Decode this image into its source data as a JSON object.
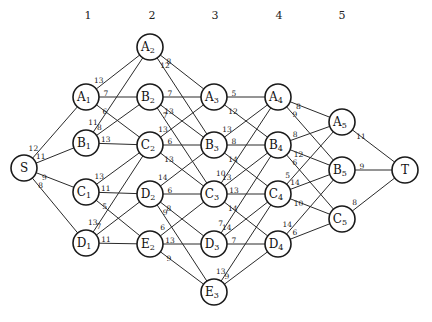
{
  "diagram": {
    "type": "directed-stage-graph",
    "stage_headers": [
      {
        "label": "1",
        "x": 88,
        "y": 19
      },
      {
        "label": "2",
        "x": 152,
        "y": 19
      },
      {
        "label": "3",
        "x": 215,
        "y": 19
      },
      {
        "label": "4",
        "x": 279,
        "y": 19
      },
      {
        "label": "5",
        "x": 342,
        "y": 19
      }
    ],
    "node_radius": 13,
    "nodes": [
      {
        "id": "S",
        "letter": "S",
        "sub": "",
        "x": 24,
        "y": 168
      },
      {
        "id": "A1",
        "letter": "A",
        "sub": "1",
        "x": 86,
        "y": 97
      },
      {
        "id": "B1",
        "letter": "B",
        "sub": "1",
        "x": 86,
        "y": 143
      },
      {
        "id": "C1",
        "letter": "C",
        "sub": "1",
        "x": 86,
        "y": 192
      },
      {
        "id": "D1",
        "letter": "D",
        "sub": "1",
        "x": 86,
        "y": 243
      },
      {
        "id": "A2",
        "letter": "A",
        "sub": "2",
        "x": 150,
        "y": 47
      },
      {
        "id": "B2",
        "letter": "B",
        "sub": "2",
        "x": 150,
        "y": 97
      },
      {
        "id": "C2",
        "letter": "C",
        "sub": "2",
        "x": 150,
        "y": 145
      },
      {
        "id": "D2",
        "letter": "D",
        "sub": "2",
        "x": 150,
        "y": 194
      },
      {
        "id": "E2",
        "letter": "E",
        "sub": "2",
        "x": 150,
        "y": 244
      },
      {
        "id": "A3",
        "letter": "A",
        "sub": "3",
        "x": 214,
        "y": 97
      },
      {
        "id": "B3",
        "letter": "B",
        "sub": "3",
        "x": 214,
        "y": 145
      },
      {
        "id": "C3",
        "letter": "C",
        "sub": "3",
        "x": 214,
        "y": 194
      },
      {
        "id": "D3",
        "letter": "D",
        "sub": "3",
        "x": 214,
        "y": 244
      },
      {
        "id": "E3",
        "letter": "E",
        "sub": "3",
        "x": 214,
        "y": 292
      },
      {
        "id": "A4",
        "letter": "A",
        "sub": "4",
        "x": 278,
        "y": 97
      },
      {
        "id": "B4",
        "letter": "B",
        "sub": "4",
        "x": 278,
        "y": 145
      },
      {
        "id": "C4",
        "letter": "C",
        "sub": "4",
        "x": 278,
        "y": 194
      },
      {
        "id": "D4",
        "letter": "D",
        "sub": "4",
        "x": 278,
        "y": 244
      },
      {
        "id": "A5",
        "letter": "A",
        "sub": "5",
        "x": 342,
        "y": 122
      },
      {
        "id": "B5",
        "letter": "B",
        "sub": "5",
        "x": 342,
        "y": 170
      },
      {
        "id": "C5",
        "letter": "C",
        "sub": "5",
        "x": 342,
        "y": 219
      },
      {
        "id": "T",
        "letter": "T",
        "sub": "",
        "x": 405,
        "y": 170
      }
    ],
    "edges": [
      {
        "from": "S",
        "to": "A1",
        "weight": "12"
      },
      {
        "from": "S",
        "to": "B1",
        "weight": "11"
      },
      {
        "from": "S",
        "to": "C1",
        "weight": "9"
      },
      {
        "from": "S",
        "to": "D1",
        "weight": "8"
      },
      {
        "from": "A1",
        "to": "A2",
        "weight": "13"
      },
      {
        "from": "A1",
        "to": "B2",
        "weight": "7"
      },
      {
        "from": "A1",
        "to": "C2",
        "weight": "6"
      },
      {
        "from": "B1",
        "to": "A2",
        "weight": "11"
      },
      {
        "from": "B1",
        "to": "B2",
        "weight": "8"
      },
      {
        "from": "B1",
        "to": "C2",
        "weight": "13"
      },
      {
        "from": "C1",
        "to": "C2",
        "weight": "13"
      },
      {
        "from": "C1",
        "to": "D2",
        "weight": "11"
      },
      {
        "from": "C1",
        "to": "E2",
        "weight": "5"
      },
      {
        "from": "D1",
        "to": "C2",
        "weight": "13"
      },
      {
        "from": "D1",
        "to": "D2",
        "weight": "7"
      },
      {
        "from": "D1",
        "to": "E2",
        "weight": "11"
      },
      {
        "from": "A2",
        "to": "A3",
        "weight": "8"
      },
      {
        "from": "A2",
        "to": "B3",
        "weight": "12"
      },
      {
        "from": "B2",
        "to": "A3",
        "weight": "7"
      },
      {
        "from": "B2",
        "to": "B3",
        "weight": "13"
      },
      {
        "from": "B2",
        "to": "C3",
        "weight": "7"
      },
      {
        "from": "C2",
        "to": "A3",
        "weight": "13"
      },
      {
        "from": "C2",
        "to": "B3",
        "weight": "6"
      },
      {
        "from": "C2",
        "to": "C3",
        "weight": "13"
      },
      {
        "from": "D2",
        "to": "B3",
        "weight": "14"
      },
      {
        "from": "D2",
        "to": "C3",
        "weight": "6"
      },
      {
        "from": "D2",
        "to": "D3",
        "weight": "8"
      },
      {
        "from": "D2",
        "to": "E3",
        "weight": "9"
      },
      {
        "from": "E2",
        "to": "C3",
        "weight": "6"
      },
      {
        "from": "E2",
        "to": "D3",
        "weight": "13"
      },
      {
        "from": "E2",
        "to": "E3",
        "weight": "9"
      },
      {
        "from": "A3",
        "to": "A4",
        "weight": "5"
      },
      {
        "from": "A3",
        "to": "B4",
        "weight": "12"
      },
      {
        "from": "B3",
        "to": "A4",
        "weight": "13"
      },
      {
        "from": "B3",
        "to": "B4",
        "weight": "8"
      },
      {
        "from": "B3",
        "to": "C4",
        "weight": "14"
      },
      {
        "from": "C3",
        "to": "A4",
        "weight": "10"
      },
      {
        "from": "C3",
        "to": "B4",
        "weight": "13"
      },
      {
        "from": "C3",
        "to": "C4",
        "weight": "13"
      },
      {
        "from": "C3",
        "to": "D4",
        "weight": "14"
      },
      {
        "from": "D3",
        "to": "B4",
        "weight": "7"
      },
      {
        "from": "D3",
        "to": "C4",
        "weight": "14"
      },
      {
        "from": "D3",
        "to": "D4",
        "weight": "7"
      },
      {
        "from": "E3",
        "to": "C4",
        "weight": "13"
      },
      {
        "from": "E3",
        "to": "D4",
        "weight": "9"
      },
      {
        "from": "A4",
        "to": "A5",
        "weight": "8"
      },
      {
        "from": "A4",
        "to": "B5",
        "weight": "9"
      },
      {
        "from": "B4",
        "to": "A5",
        "weight": "8"
      },
      {
        "from": "B4",
        "to": "B5",
        "weight": "12"
      },
      {
        "from": "B4",
        "to": "C5",
        "weight": "6"
      },
      {
        "from": "C4",
        "to": "A5",
        "weight": "5"
      },
      {
        "from": "C4",
        "to": "B5",
        "weight": "14"
      },
      {
        "from": "C4",
        "to": "C5",
        "weight": "10"
      },
      {
        "from": "D4",
        "to": "B5",
        "weight": "14"
      },
      {
        "from": "D4",
        "to": "C5",
        "weight": "6"
      },
      {
        "from": "A5",
        "to": "T",
        "weight": "11"
      },
      {
        "from": "B5",
        "to": "T",
        "weight": "9"
      },
      {
        "from": "C5",
        "to": "T",
        "weight": "8"
      }
    ]
  }
}
